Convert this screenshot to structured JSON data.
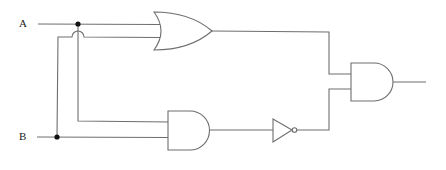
{
  "diagram": {
    "type": "logic-circuit",
    "inputs": [
      {
        "label": "A"
      },
      {
        "label": "B"
      }
    ],
    "gates": [
      {
        "id": "or1",
        "type": "OR",
        "inputs": [
          "A",
          "B"
        ]
      },
      {
        "id": "and1",
        "type": "AND",
        "inputs": [
          "A",
          "B"
        ]
      },
      {
        "id": "not1",
        "type": "NOT",
        "inputs": [
          "and1"
        ]
      },
      {
        "id": "and2",
        "type": "AND",
        "inputs": [
          "or1",
          "not1"
        ]
      }
    ],
    "output": "and2",
    "colors": {
      "wire": "#6e6e6e",
      "junction": "#111111",
      "background": "#ffffff"
    }
  }
}
